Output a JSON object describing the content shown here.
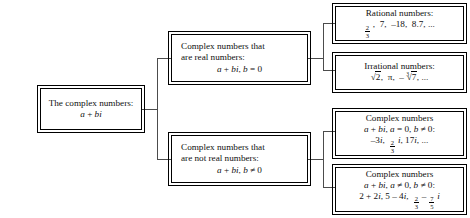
{
  "diagram": {
    "line_color": "#4c4c4c",
    "border_color": "#000000",
    "background": "#ffffff",
    "nodes": {
      "root": {
        "name": "the-complex-numbers",
        "line1": "The complex numbers:",
        "line2_plain": "a + bi"
      },
      "real": {
        "name": "complex-numbers-that-are-real",
        "line1": "Complex numbers that",
        "line2": "are real numbers:",
        "line3_plain": "a + bi, b = 0"
      },
      "not_real": {
        "name": "complex-numbers-that-are-not-real",
        "line1": "Complex numbers that",
        "line2": "are not real numbers:",
        "line3_plain": "a + bi, b ≠ 0"
      },
      "rational": {
        "name": "rational-numbers",
        "line1": "Rational numbers:",
        "examples_plain": "2/3, 7, –18, 8.7, ..."
      },
      "irrational": {
        "name": "irrational-numbers",
        "line1": "Irrational numbers:",
        "examples_plain": "√2, π, –∛7, ..."
      },
      "imaginary": {
        "name": "pure-imaginary-numbers",
        "line1": "Complex numbers",
        "line2_plain": "a + bi, a = 0, b ≠ 0:",
        "examples_plain": "–3i, (2/3)i, 17i, ..."
      },
      "nonreal": {
        "name": "nonreal-complex-numbers",
        "line1": "Complex numbers",
        "line2_plain": "a + bi, a ≠ 0, b ≠ 0:",
        "examples_plain": "2 + 2i, 5 – 4i, 2/3 – (7/5)i"
      }
    },
    "symbols": {
      "plus": "+",
      "minus": "–",
      "equals": "=",
      "not_equals": "≠",
      "pi": "π",
      "ellipsis": "...",
      "comma": ",",
      "colon": ":",
      "zero": "0",
      "a": "a",
      "b": "b",
      "i": "i",
      "seven": "7",
      "eighteen": "18",
      "eight_point_seven": "8.7",
      "two": "2",
      "three": "3",
      "five": "5",
      "four": "4",
      "seventeen": "17",
      "radical": "√",
      "cube_index": "3"
    }
  }
}
